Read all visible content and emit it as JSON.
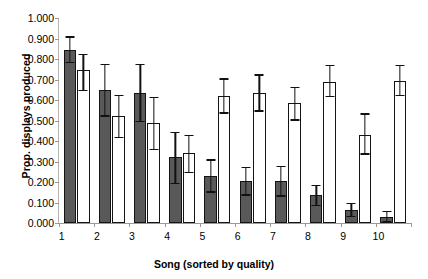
{
  "chart_data": {
    "type": "bar",
    "title": "",
    "xlabel": "Song (sorted by quality)",
    "ylabel": "Prop. displays produced",
    "categories": [
      "1",
      "2",
      "3",
      "4",
      "5",
      "6",
      "7",
      "8",
      "9",
      "10"
    ],
    "ylim": [
      0.0,
      1.0
    ],
    "ytick_labels": [
      "0.000",
      "0.100",
      "0.200",
      "0.300",
      "0.400",
      "0.500",
      "0.600",
      "0.700",
      "0.800",
      "0.900",
      "1.000"
    ],
    "ytick_values": [
      0.0,
      0.1,
      0.2,
      0.3,
      0.4,
      0.5,
      0.6,
      0.7,
      0.8,
      0.9,
      1.0
    ],
    "grid": false,
    "legend": "none",
    "series": [
      {
        "name": "dark",
        "fill": "#595959",
        "values": [
          0.845,
          0.65,
          0.635,
          0.32,
          0.23,
          0.205,
          0.205,
          0.135,
          0.065,
          0.03
        ],
        "err_low": [
          0.785,
          0.525,
          0.5,
          0.195,
          0.155,
          0.14,
          0.135,
          0.09,
          0.035,
          0.01
        ],
        "err_high": [
          0.91,
          0.775,
          0.775,
          0.445,
          0.31,
          0.275,
          0.28,
          0.185,
          0.1,
          0.06
        ]
      },
      {
        "name": "light",
        "fill": "#ffffff",
        "values": [
          0.745,
          0.52,
          0.49,
          0.34,
          0.62,
          0.635,
          0.585,
          0.69,
          0.43,
          0.695
        ],
        "err_low": [
          0.65,
          0.42,
          0.36,
          0.25,
          0.54,
          0.55,
          0.505,
          0.62,
          0.34,
          0.625
        ],
        "err_high": [
          0.825,
          0.625,
          0.615,
          0.43,
          0.705,
          0.725,
          0.665,
          0.77,
          0.535,
          0.77
        ]
      }
    ]
  }
}
